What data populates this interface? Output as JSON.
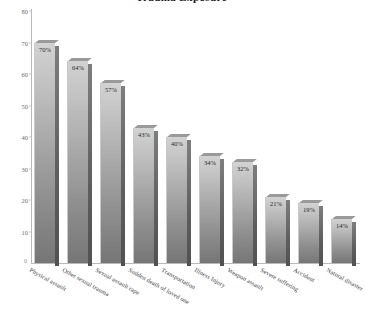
{
  "chart_data": {
    "type": "bar",
    "title": "Trauma Exposure",
    "xlabel": "",
    "ylabel": "",
    "ylim": [
      0,
      80
    ],
    "yticks": [
      10,
      20,
      30,
      40,
      50,
      60,
      70,
      80
    ],
    "grid": false,
    "legend": "none",
    "origin_label": "0",
    "categories": [
      "Physical assault",
      "Other sexual trauma",
      "Sexual assault rape",
      "Sudden death of loved one",
      "Transportation",
      "Illness Injury",
      "Weapon assault",
      "Severe suffering",
      "Accident",
      "Natural disaster"
    ],
    "values": [
      70,
      64,
      57,
      43,
      40,
      34,
      32,
      21,
      19,
      14
    ],
    "value_labels": [
      "70%",
      "64%",
      "57%",
      "43%",
      "40%",
      "34%",
      "32%",
      "21%",
      "19%",
      "14%"
    ],
    "colors": {
      "bar_face_top": "#d2d2d2",
      "bar_face_bottom": "#767676",
      "bar_side": "#5e5e5e",
      "bar_top": "#9a9a9a",
      "axis": "#b9b9b9",
      "tick_text": "#6e6e6e",
      "label_text": "#2a2a2a",
      "background": "#ffffff"
    }
  }
}
